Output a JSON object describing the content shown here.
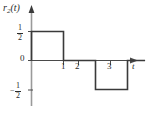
{
  "figure": {
    "name": "signal-waveform-plot",
    "background_color": "#ffffff",
    "line_color": "#3a3a3a",
    "text_color": "#2b2b2b"
  },
  "axes": {
    "y_axis_title": "r",
    "y_axis_title_subscript": "2",
    "y_axis_title_arg": "(t)",
    "x_axis_label": "t",
    "y_ticks": [
      {
        "name": "y-tick-half",
        "numerator": "1",
        "denominator": "2",
        "sign": "",
        "value": 0.5
      },
      {
        "name": "y-tick-zero",
        "label": "0",
        "value": 0
      },
      {
        "name": "y-tick-neg-half",
        "numerator": "1",
        "denominator": "2",
        "sign": "−",
        "value": -0.5
      }
    ],
    "x_ticks": [
      {
        "name": "x-tick-1",
        "label": "1",
        "value": 1
      },
      {
        "name": "x-tick-2",
        "label": "2",
        "value": 2
      },
      {
        "name": "x-tick-3",
        "label": "3",
        "value": 3
      }
    ]
  },
  "chart_data": {
    "type": "line",
    "title": "r2(t)",
    "xlabel": "t",
    "ylabel": "r2(t)",
    "xlim": [
      0,
      3.7
    ],
    "ylim": [
      -0.75,
      0.75
    ],
    "grid": false,
    "legend": null,
    "x_tick_values": [
      1,
      2,
      3
    ],
    "y_tick_values": [
      0.5,
      0,
      -0.5
    ],
    "series": [
      {
        "name": "r2(t)",
        "x": [
          0,
          0,
          1,
          1,
          2,
          2,
          3,
          3,
          3.55
        ],
        "y": [
          0,
          0.5,
          0.5,
          0,
          0,
          -0.5,
          -0.5,
          0,
          0
        ]
      }
    ],
    "segments": [
      {
        "name": "positive-pulse",
        "t_start": 0,
        "t_end": 1,
        "amplitude": 0.5
      },
      {
        "name": "zero-gap",
        "t_start": 1,
        "t_end": 2,
        "amplitude": 0
      },
      {
        "name": "negative-pulse",
        "t_start": 2,
        "t_end": 3,
        "amplitude": -0.5
      },
      {
        "name": "zero-tail",
        "t_start": 3,
        "t_end": 3.55,
        "amplitude": 0
      }
    ]
  }
}
